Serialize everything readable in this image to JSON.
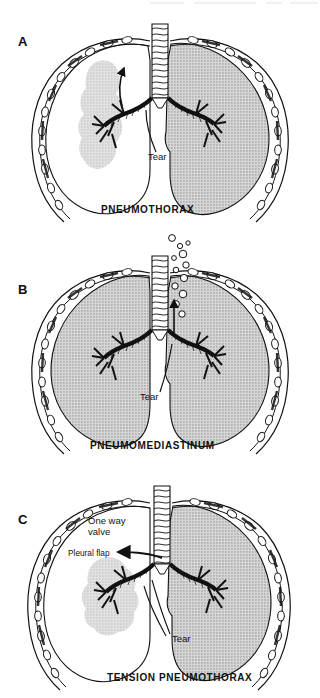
{
  "figure": {
    "background_color": "#ffffff",
    "ink_color": "#111111",
    "lung_fill_color": "#c9c9c9",
    "collapsed_lung_color": "#c6c6c6",
    "panel_count": 3
  },
  "panels": [
    {
      "letter": "A",
      "title": "PNEUMOTHORAX",
      "annotations": [
        {
          "name": "tear-label",
          "text": "Tear"
        }
      ],
      "arrows": [
        {
          "name": "air-escape-arrow",
          "direction": "up",
          "meaning": "air escaping into pleural space"
        }
      ],
      "lungs": {
        "left_side": "collapsed, small grey opacity with surrounding air in pleural space",
        "right_side": "normally expanded, grey shaded"
      },
      "bubbles": []
    },
    {
      "letter": "B",
      "title": "PNEUMOMEDIASTINUM",
      "annotations": [
        {
          "name": "tear-label",
          "text": "Tear"
        }
      ],
      "arrows": [
        {
          "name": "air-tracking-arrow",
          "direction": "up",
          "meaning": "air tracking up mediastinum along trachea"
        }
      ],
      "lungs": {
        "left_side": "expanded, grey shaded",
        "right_side": "expanded, grey shaded"
      },
      "bubbles": [
        {
          "cx": 158,
          "cy": 238,
          "r": 3.2
        },
        {
          "cx": 164,
          "cy": 246,
          "r": 2.4
        },
        {
          "cx": 171,
          "cy": 243,
          "r": 2.0
        },
        {
          "cx": 166,
          "cy": 253,
          "r": 3.6
        },
        {
          "cx": 159,
          "cy": 258,
          "r": 2.2
        },
        {
          "cx": 170,
          "cy": 262,
          "r": 3.0
        },
        {
          "cx": 163,
          "cy": 268,
          "r": 2.6
        },
        {
          "cx": 171,
          "cy": 274,
          "r": 3.4
        },
        {
          "cx": 164,
          "cy": 281,
          "r": 3.0
        },
        {
          "cx": 171,
          "cy": 289,
          "r": 3.6
        }
      ]
    },
    {
      "letter": "C",
      "title": "TENSION PNEUMOTHORAX",
      "annotations": [
        {
          "name": "one-way-valve-label",
          "text": "One way",
          "text2": "valve"
        },
        {
          "name": "pleural-flap-label",
          "text": "Pleural flap"
        },
        {
          "name": "tear-label",
          "text": "Tear"
        }
      ],
      "arrows": [
        {
          "name": "one-way-valve-arrow",
          "direction": "left",
          "meaning": "one-way valve air entry into pleural space"
        }
      ],
      "lungs": {
        "left_side": "collapsed, small grey opacity, large air space under tension",
        "right_side": "expanded, grey shaded, shifted"
      },
      "bubbles": []
    }
  ]
}
